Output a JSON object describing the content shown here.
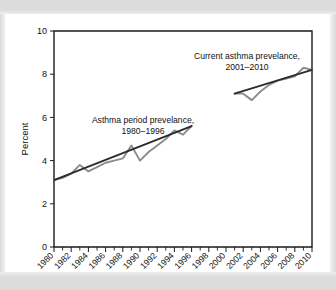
{
  "figure": {
    "axis_title_y": "Percent"
  },
  "chart_data": {
    "type": "line",
    "title": "",
    "xlabel": "",
    "ylabel": "Percent",
    "xlim": [
      1980,
      2010
    ],
    "ylim": [
      0,
      10
    ],
    "grid": false,
    "legend_position": "inline-annotations",
    "y_ticks": [
      "0",
      "2",
      "4",
      "6",
      "8",
      "10"
    ],
    "y_tick_values": [
      0,
      2,
      4,
      6,
      8,
      10
    ],
    "x_ticks": [
      "1980",
      "1982",
      "1984",
      "1986",
      "1988",
      "1990",
      "1992",
      "1994",
      "1996",
      "1998",
      "2000",
      "2002",
      "2004",
      "2006",
      "2008",
      "2010"
    ],
    "x_tick_values": [
      1980,
      1982,
      1984,
      1986,
      1988,
      1990,
      1992,
      1994,
      1996,
      1998,
      2000,
      2002,
      2004,
      2006,
      2008,
      2010
    ],
    "x_minor_tick_values": [
      1981,
      1983,
      1985,
      1987,
      1989,
      1991,
      1993,
      1995,
      1997,
      1999,
      2001,
      2003,
      2005,
      2007,
      2009
    ],
    "annotations": [
      {
        "id": "period-prevalence",
        "line1": "Asthma period prevelance,",
        "line2": "1980–1996"
      },
      {
        "id": "current-prevalence",
        "line1": "Current asthma prevelance,",
        "line2": "2001–2010"
      }
    ],
    "series": [
      {
        "name": "Asthma period prevelance, 1980–1996",
        "kind": "observed",
        "color": "#8c8c8c",
        "x": [
          1980,
          1981,
          1982,
          1983,
          1984,
          1985,
          1986,
          1987,
          1988,
          1989,
          1990,
          1991,
          1992,
          1993,
          1994,
          1995,
          1996
        ],
        "values": [
          3.1,
          3.2,
          3.4,
          3.8,
          3.5,
          3.7,
          3.9,
          4.0,
          4.1,
          4.7,
          4.0,
          4.4,
          4.7,
          5.0,
          5.4,
          5.2,
          5.6
        ]
      },
      {
        "name": "Asthma period prevelance trend, 1980–1996",
        "kind": "trend",
        "color": "#2b2b2b",
        "x": [
          1980,
          1996
        ],
        "values": [
          3.1,
          5.6
        ]
      },
      {
        "name": "Current asthma prevelance, 2001–2010",
        "kind": "observed",
        "color": "#8c8c8c",
        "x": [
          2001,
          2002,
          2003,
          2004,
          2005,
          2006,
          2007,
          2008,
          2009,
          2010
        ],
        "values": [
          7.1,
          7.1,
          6.8,
          7.2,
          7.5,
          7.7,
          7.8,
          7.9,
          8.3,
          8.2
        ]
      },
      {
        "name": "Current asthma prevelance trend, 2001–2010",
        "kind": "trend",
        "color": "#2b2b2b",
        "x": [
          2001,
          2010
        ],
        "values": [
          7.1,
          8.2
        ]
      }
    ]
  }
}
